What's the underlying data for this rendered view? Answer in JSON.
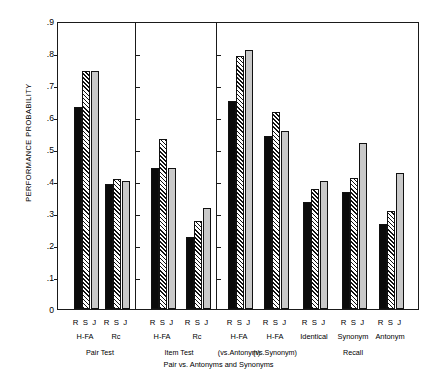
{
  "chart_data": {
    "type": "bar",
    "title": "Pair vs. Antonyms and Synonyms",
    "xlabel": "",
    "ylabel": "PERFORMANCE PROBABILITY",
    "ylim": [
      0,
      0.9
    ],
    "yticks": [
      ".9",
      ".8",
      ".7",
      ".6",
      ".5",
      ".4",
      ".3",
      ".2",
      ".1",
      "0"
    ],
    "ytick_values": [
      0.9,
      0.8,
      0.7,
      0.6,
      0.5,
      0.4,
      0.3,
      0.2,
      0.1,
      0.0
    ],
    "grid": false,
    "legend_position": "none",
    "series": [
      {
        "name": "R",
        "style": "solid-black",
        "values": [
          0.63,
          0.39,
          0.44,
          0.225,
          0.65,
          0.54,
          0.335,
          0.365,
          0.265
        ]
      },
      {
        "name": "S",
        "style": "diagonal-hatch",
        "values": [
          0.745,
          0.405,
          0.53,
          0.275,
          0.79,
          0.615,
          0.375,
          0.41,
          0.305
        ]
      },
      {
        "name": "J",
        "style": "light-gray",
        "values": [
          0.745,
          0.4,
          0.44,
          0.315,
          0.81,
          0.555,
          0.4,
          0.52,
          0.425
        ]
      }
    ],
    "categories": [
      "H-FA",
      "Rc",
      "H-FA",
      "Rc",
      "H-FA (vs.Antonym)",
      "H-FA (vs.Synonym)",
      "Identical",
      "Synonym",
      "Antonym"
    ],
    "bar_tick_labels": [
      "R",
      "S",
      "J"
    ],
    "panels": [
      {
        "label": "Pair Test",
        "groups": [
          "H-FA",
          "Rc"
        ]
      },
      {
        "label": "Item Test",
        "groups": [
          "H-FA",
          "Rc"
        ]
      },
      {
        "label": "Pair vs. Antonyms and Synonyms",
        "groups": [
          "H-FA",
          "H-FA",
          "Identical",
          "Synonym",
          "Antonym"
        ]
      }
    ],
    "sublabels": [
      "(vs.Antonym)",
      "(vs.Synonym)",
      "Recall"
    ],
    "colors": {
      "R": "#0b0b0b",
      "S": "#111111",
      "J": "#c9c9c9",
      "axis": "#1a1a1a",
      "background": "#ffffff"
    }
  },
  "axis": {
    "y_title": "PERFORMANCE PROBABILITY"
  },
  "groups": [
    {
      "id": "g1",
      "tick_label": "R S J",
      "name": "H-FA"
    },
    {
      "id": "g2",
      "tick_label": "R S J",
      "name": "Rc"
    },
    {
      "id": "g3",
      "tick_label": "R S J",
      "name": "H-FA"
    },
    {
      "id": "g4",
      "tick_label": "R S J",
      "name": "Rc"
    },
    {
      "id": "g5",
      "tick_label": "R S J",
      "name": "H-FA"
    },
    {
      "id": "g6",
      "tick_label": "R S J",
      "name": "H-FA"
    },
    {
      "id": "g7",
      "tick_label": "R S J",
      "name": "Identical"
    },
    {
      "id": "g8",
      "tick_label": "R S J",
      "name": "Synonym"
    },
    {
      "id": "g9",
      "tick_label": "R S J",
      "name": "Antonym"
    }
  ],
  "panel_labels": {
    "pair_test": "Pair Test",
    "item_test": "Item Test",
    "vs_antonym": "(vs.Antonym)",
    "vs_synonym": "(vs.Synonym)",
    "recall": "Recall"
  },
  "title": "Pair vs. Antonyms and Synonyms"
}
